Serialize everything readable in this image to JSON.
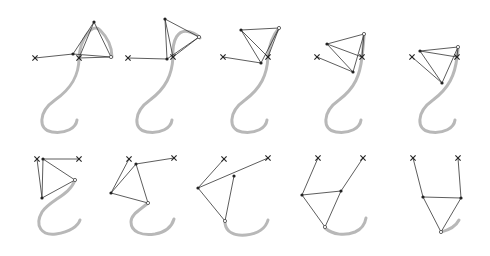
{
  "figure": {
    "colors": {
      "curve": "#b8b8b8",
      "link": "#333333",
      "joint": "#222222",
      "background": "#ffffff"
    }
  },
  "panels": [
    {
      "id": "p1",
      "curve": "M79 58 C79 75 72 88 55 100 C38 112 38 130 52 132 C66 134 76 128 77 120 M79 58 C80 40 92 22 100 30 C108 38 112 48 112 57",
      "anchors": [
        [
          35,
          58
        ],
        [
          79,
          58
        ]
      ],
      "joints": [
        [
          73,
          54
        ],
        [
          94,
          22
        ]
      ],
      "end": [
        111,
        57
      ],
      "links": [
        [
          [
            35,
            58
          ],
          [
            73,
            54
          ]
        ],
        [
          [
            73,
            54
          ],
          [
            94,
            22
          ]
        ],
        [
          [
            79,
            58
          ],
          [
            94,
            22
          ]
        ],
        [
          [
            94,
            22
          ],
          [
            111,
            57
          ]
        ],
        [
          [
            73,
            54
          ],
          [
            111,
            57
          ]
        ],
        [
          [
            79,
            58
          ],
          [
            111,
            57
          ]
        ]
      ]
    },
    {
      "id": "p2",
      "curve": "M173 57 C172 75 166 88 150 100 C133 112 133 130 147 132 C161 134 171 128 172 120 M173 57 C172 40 178 28 190 32 C196 34 199 36 200 38",
      "anchors": [
        [
          128,
          58
        ],
        [
          173,
          57
        ]
      ],
      "joints": [
        [
          167,
          59
        ],
        [
          165,
          19
        ]
      ],
      "end": [
        199,
        37
      ],
      "links": [
        [
          [
            128,
            58
          ],
          [
            167,
            59
          ]
        ],
        [
          [
            167,
            59
          ],
          [
            165,
            19
          ]
        ],
        [
          [
            173,
            57
          ],
          [
            165,
            19
          ]
        ],
        [
          [
            165,
            19
          ],
          [
            199,
            37
          ]
        ],
        [
          [
            167,
            59
          ],
          [
            199,
            37
          ]
        ],
        [
          [
            173,
            57
          ],
          [
            199,
            37
          ]
        ]
      ]
    },
    {
      "id": "p3",
      "curve": "M268 57 C267 75 261 88 245 100 C228 112 228 130 242 132 C256 134 266 128 267 120 M268 57 C269 45 273 35 279 28",
      "anchors": [
        [
          223,
          57
        ],
        [
          268,
          57
        ]
      ],
      "joints": [
        [
          261,
          63
        ],
        [
          241,
          30
        ]
      ],
      "end": [
        279,
        28
      ],
      "links": [
        [
          [
            223,
            57
          ],
          [
            261,
            63
          ]
        ],
        [
          [
            261,
            63
          ],
          [
            241,
            30
          ]
        ],
        [
          [
            268,
            57
          ],
          [
            241,
            30
          ]
        ],
        [
          [
            241,
            30
          ],
          [
            279,
            28
          ]
        ],
        [
          [
            261,
            63
          ],
          [
            279,
            28
          ]
        ],
        [
          [
            268,
            57
          ],
          [
            279,
            28
          ]
        ]
      ]
    },
    {
      "id": "p4",
      "curve": "M362 57 C360 75 355 88 339 100 C322 112 322 130 336 132 C350 134 360 128 361 120 M362 57 C363 48 364 40 364 34",
      "anchors": [
        [
          317,
          57
        ],
        [
          362,
          57
        ]
      ],
      "joints": [
        [
          327,
          44
        ],
        [
          353,
          72
        ]
      ],
      "end": [
        364,
        34
      ],
      "links": [
        [
          [
            317,
            57
          ],
          [
            353,
            72
          ]
        ],
        [
          [
            327,
            44
          ],
          [
            353,
            72
          ]
        ],
        [
          [
            327,
            44
          ],
          [
            362,
            57
          ]
        ],
        [
          [
            327,
            44
          ],
          [
            364,
            34
          ]
        ],
        [
          [
            353,
            72
          ],
          [
            364,
            34
          ]
        ],
        [
          [
            362,
            57
          ],
          [
            364,
            34
          ]
        ]
      ]
    },
    {
      "id": "p5",
      "curve": "M457 57 C455 75 449 88 433 100 C416 112 416 130 430 132 C444 134 454 128 455 120 M457 57 C458 53 458 50 458 47",
      "anchors": [
        [
          412,
          57
        ],
        [
          457,
          57
        ]
      ],
      "joints": [
        [
          420,
          51
        ],
        [
          442,
          83
        ]
      ],
      "end": [
        458,
        47
      ],
      "links": [
        [
          [
            412,
            57
          ],
          [
            442,
            83
          ]
        ],
        [
          [
            420,
            51
          ],
          [
            442,
            83
          ]
        ],
        [
          [
            420,
            51
          ],
          [
            457,
            57
          ]
        ],
        [
          [
            420,
            51
          ],
          [
            458,
            47
          ]
        ],
        [
          [
            442,
            83
          ],
          [
            458,
            47
          ]
        ],
        [
          [
            457,
            57
          ],
          [
            458,
            47
          ]
        ]
      ]
    },
    {
      "id": "p6",
      "curve": "M75 180 C70 195 50 200 42 212 C34 226 42 236 56 234 C70 232 78 226 80 220",
      "anchors": [
        [
          37,
          159
        ],
        [
          79,
          159
        ]
      ],
      "joints": [
        [
          43,
          159
        ],
        [
          42,
          198
        ]
      ],
      "end": [
        75,
        180
      ],
      "links": [
        [
          [
            37,
            159
          ],
          [
            42,
            198
          ]
        ],
        [
          [
            43,
            159
          ],
          [
            42,
            198
          ]
        ],
        [
          [
            43,
            159
          ],
          [
            79,
            159
          ]
        ],
        [
          [
            43,
            159
          ],
          [
            75,
            180
          ]
        ],
        [
          [
            42,
            198
          ],
          [
            75,
            180
          ]
        ]
      ]
    },
    {
      "id": "p7",
      "curve": "M148 203 C140 210 131 214 131 222 C131 232 142 236 155 234 C166 232 172 226 174 219",
      "anchors": [
        [
          129,
          159
        ],
        [
          174,
          158
        ]
      ],
      "joints": [
        [
          136,
          164
        ],
        [
          111,
          193
        ]
      ],
      "end": [
        148,
        203
      ],
      "links": [
        [
          [
            129,
            159
          ],
          [
            111,
            193
          ]
        ],
        [
          [
            136,
            164
          ],
          [
            111,
            193
          ]
        ],
        [
          [
            136,
            164
          ],
          [
            174,
            158
          ]
        ],
        [
          [
            136,
            164
          ],
          [
            148,
            203
          ]
        ],
        [
          [
            111,
            193
          ],
          [
            148,
            203
          ]
        ]
      ]
    },
    {
      "id": "p8",
      "curve": "M225 223 C226 232 234 236 246 235 C258 234 266 228 268 220",
      "anchors": [
        [
          224,
          159
        ],
        [
          268,
          158
        ]
      ],
      "joints": [
        [
          234,
          176
        ],
        [
          198,
          188
        ]
      ],
      "end": [
        225,
        221
      ],
      "links": [
        [
          [
            224,
            159
          ],
          [
            198,
            188
          ]
        ],
        [
          [
            198,
            188
          ],
          [
            268,
            158
          ]
        ],
        [
          [
            234,
            176
          ],
          [
            225,
            221
          ]
        ],
        [
          [
            198,
            188
          ],
          [
            225,
            221
          ]
        ]
      ]
    },
    {
      "id": "p9",
      "curve": "M325 228 C333 235 345 236 355 232 C362 229 365 224 366 218",
      "anchors": [
        [
          318,
          158
        ],
        [
          363,
          158
        ]
      ],
      "joints": [
        [
          302,
          195
        ],
        [
          341,
          191
        ]
      ],
      "end": [
        325,
        227
      ],
      "links": [
        [
          [
            318,
            158
          ],
          [
            302,
            195
          ]
        ],
        [
          [
            341,
            191
          ],
          [
            363,
            158
          ]
        ],
        [
          [
            302,
            195
          ],
          [
            341,
            191
          ]
        ],
        [
          [
            302,
            195
          ],
          [
            325,
            227
          ]
        ],
        [
          [
            341,
            191
          ],
          [
            325,
            227
          ]
        ]
      ]
    },
    {
      "id": "p10",
      "curve": "M441 232 C449 230 456 226 459 220",
      "anchors": [
        [
          413,
          158
        ],
        [
          458,
          158
        ]
      ],
      "joints": [
        [
          423,
          197
        ],
        [
          461,
          198
        ]
      ],
      "end": [
        441,
        232
      ],
      "links": [
        [
          [
            413,
            158
          ],
          [
            423,
            197
          ]
        ],
        [
          [
            458,
            158
          ],
          [
            461,
            198
          ]
        ],
        [
          [
            423,
            197
          ],
          [
            461,
            198
          ]
        ],
        [
          [
            423,
            197
          ],
          [
            441,
            232
          ]
        ],
        [
          [
            461,
            198
          ],
          [
            441,
            232
          ]
        ]
      ]
    }
  ]
}
